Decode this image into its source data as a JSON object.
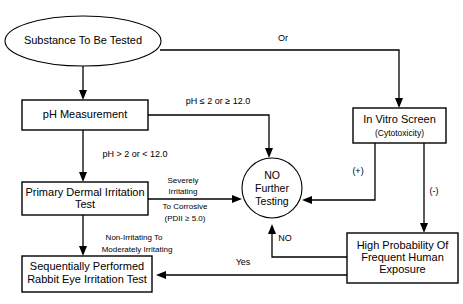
{
  "diagram": {
    "nodes": {
      "substance": {
        "label": "Substance To Be Tested",
        "shape": "ellipse"
      },
      "ph_measurement": {
        "label": "pH Measurement",
        "shape": "rect"
      },
      "primary_dermal": {
        "label_line1": "Primary Dermal Irritation",
        "label_line2": "Test",
        "shape": "rect"
      },
      "sequential_rabbit": {
        "label_line1": "Sequentially Performed",
        "label_line2": "Rabbit Eye Irritation Test",
        "shape": "rect"
      },
      "in_vitro": {
        "label": "In Vitro Screen",
        "sublabel": "(Cytotoxicity)",
        "shape": "rect"
      },
      "no_further_testing": {
        "label_line1": "NO",
        "label_line2": "Further",
        "label_line3": "Testing",
        "shape": "circle"
      },
      "high_probability": {
        "label_line1": "High Probability Of",
        "label_line2": "Frequent Human",
        "label_line3": "Exposure",
        "shape": "rect"
      }
    },
    "edge_labels": {
      "or": "Or",
      "ph_extreme": "pH ≤ 2 or ≥ 12.0",
      "ph_normal": "pH > 2 or < 12.0",
      "severe_line1": "Severely",
      "severe_line2": "Irritating",
      "severe_line3": "To Corrosive",
      "severe_line4": "(PDII ≥ 5.0)",
      "mild_line1": "Non-Irritating To",
      "mild_line2": "Moderately Irritating",
      "positive": "(+)",
      "negative": "(-)",
      "no": "NO",
      "yes": "Yes"
    },
    "colors": {
      "stroke": "#000000",
      "fill": "#ffffff",
      "text": "#000000"
    }
  }
}
